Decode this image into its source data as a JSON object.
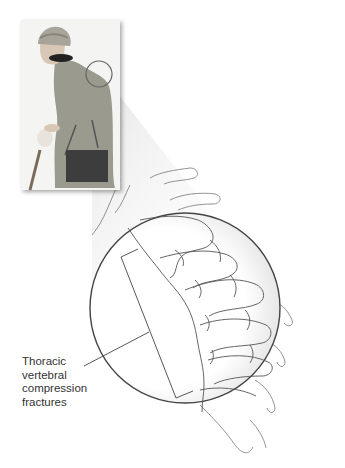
{
  "figure": {
    "inset_subject": "elderly woman with cane and handbag",
    "detail_subject": "thoracic spine, lateral view"
  },
  "annotation": {
    "lines": [
      "Thoracic",
      "vertebral",
      "compression",
      "fractures"
    ]
  },
  "colors": {
    "background": "#ffffff",
    "text": "#333333",
    "coat": "#9a9a8f",
    "hat": "#a8a49a",
    "bag": "#3d3d3d",
    "line": "#444444"
  }
}
